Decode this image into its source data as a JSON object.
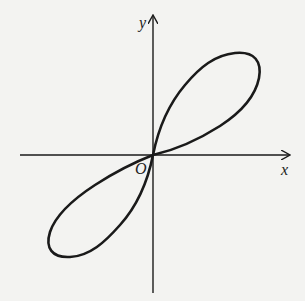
{
  "figure": {
    "type": "function-graph",
    "labels": {
      "x_axis": "x",
      "y_axis": "y",
      "origin": "O"
    },
    "colors": {
      "background": "#f3f3f1",
      "stroke": "#1a1a1a"
    }
  }
}
